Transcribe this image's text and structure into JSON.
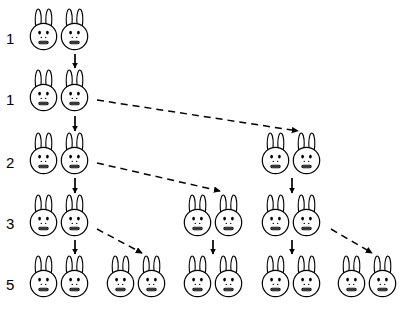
{
  "diagram": {
    "width": 406,
    "height": 318,
    "background_color": "#ffffff",
    "ink_color": "#000000"
  },
  "rows": [
    {
      "label": "1",
      "label_x": 6,
      "label_y": 31,
      "pair_count": 1,
      "pair_y": 8,
      "pairs_x": [
        28
      ]
    },
    {
      "label": "1",
      "label_x": 6,
      "label_y": 92,
      "pair_count": 1,
      "pair_y": 69,
      "pairs_x": [
        28
      ]
    },
    {
      "label": "2",
      "label_x": 6,
      "label_y": 155,
      "pair_count": 2,
      "pair_y": 132,
      "pairs_x": [
        28,
        260
      ]
    },
    {
      "label": "3",
      "label_x": 6,
      "label_y": 216,
      "pair_count": 3,
      "pair_y": 194,
      "pairs_x": [
        28,
        182,
        260
      ]
    },
    {
      "label": "5",
      "label_x": 6,
      "label_y": 277,
      "pair_count": 5,
      "pair_y": 255,
      "pairs_x": [
        28,
        105,
        182,
        260,
        336
      ]
    }
  ],
  "solid_arrows": [
    {
      "name": "arrow-row1-to-row2",
      "x1": 75,
      "y1": 54,
      "x2": 75,
      "y2": 68
    },
    {
      "name": "arrow-row2-to-row3",
      "x1": 75,
      "y1": 116,
      "x2": 75,
      "y2": 131
    },
    {
      "name": "arrow-row3a-to-row4a",
      "x1": 75,
      "y1": 178,
      "x2": 75,
      "y2": 193
    },
    {
      "name": "arrow-row3b-to-row4c",
      "x1": 292,
      "y1": 178,
      "x2": 292,
      "y2": 193
    },
    {
      "name": "arrow-row4a-to-row5a",
      "x1": 75,
      "y1": 240,
      "x2": 75,
      "y2": 254
    },
    {
      "name": "arrow-row4b-to-row5c",
      "x1": 213,
      "y1": 240,
      "x2": 213,
      "y2": 254
    },
    {
      "name": "arrow-row4c-to-row5d",
      "x1": 292,
      "y1": 240,
      "x2": 292,
      "y2": 254
    }
  ],
  "dashed_arrows": [
    {
      "name": "birth-arrow-row2-to-row3b",
      "x1": 97,
      "y1": 100,
      "x2": 298,
      "y2": 131
    },
    {
      "name": "birth-arrow-row3-to-row4b",
      "x1": 97,
      "y1": 163,
      "x2": 220,
      "y2": 191
    },
    {
      "name": "birth-arrow-row4-to-row5b",
      "x1": 97,
      "y1": 229,
      "x2": 142,
      "y2": 253
    },
    {
      "name": "birth-arrow-row4-to-row5e",
      "x1": 331,
      "y1": 229,
      "x2": 372,
      "y2": 253
    }
  ],
  "bunny_icon": {
    "name": "bunny-face-icon",
    "parts": [
      "left-ear",
      "right-ear",
      "head-circle",
      "left-eye",
      "right-eye",
      "nose-dots",
      "mouth"
    ]
  }
}
